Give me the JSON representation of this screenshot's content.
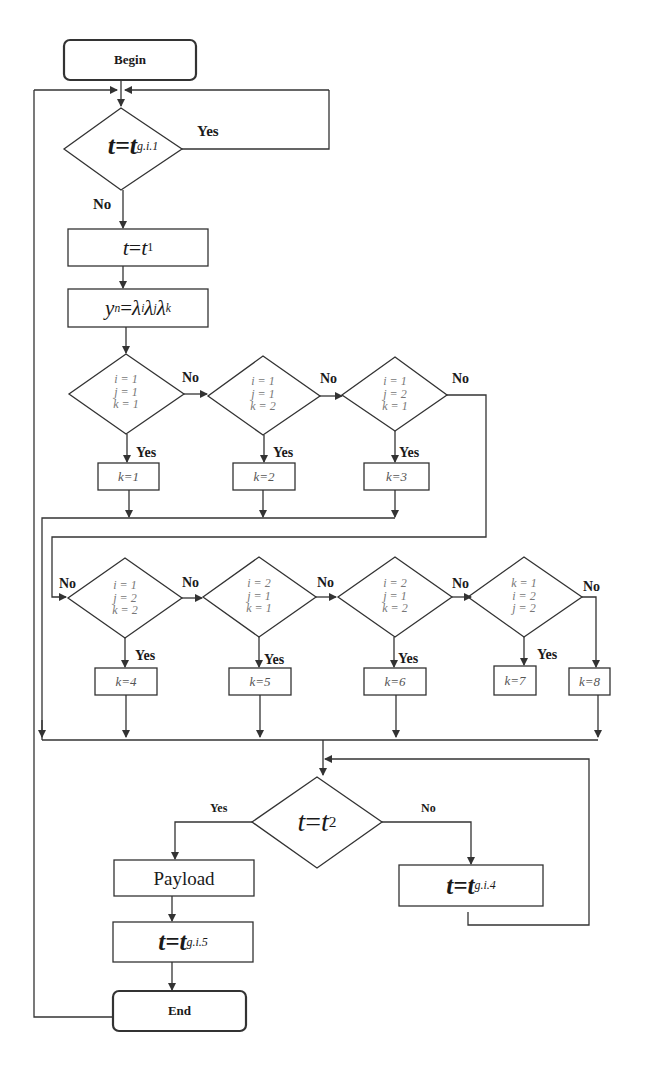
{
  "diagram": {
    "type": "flowchart",
    "start": {
      "label": "Begin"
    },
    "end": {
      "label": "End"
    },
    "decision_top": {
      "lhs": "t",
      "eq": "=",
      "rhs": "t",
      "sub": "g.i.1",
      "yes_label": "Yes",
      "no_label": "No"
    },
    "step_t1": {
      "lhs": "t",
      "eq": " = ",
      "rhs": "t",
      "sub": "1"
    },
    "step_yn": {
      "lhs": "y",
      "lhs_sub": "n",
      "eq": " = ",
      "f1": "λ",
      "s1": "i",
      "f2": "λ",
      "s2": "j",
      "f3": "λ",
      "s3": "k"
    },
    "decisions": [
      {
        "lines": [
          "i = 1",
          "j = 1",
          "k = 1"
        ],
        "yes_label": "Yes",
        "no_label": "No",
        "result": "k=1"
      },
      {
        "lines": [
          "i = 1",
          "j = 1",
          "k = 2"
        ],
        "yes_label": "Yes",
        "no_label": "No",
        "result": "k=2"
      },
      {
        "lines": [
          "i = 1",
          "j = 2",
          "k = 1"
        ],
        "yes_label": "Yes",
        "no_label": "No",
        "result": "k=3"
      },
      {
        "lines": [
          "i = 1",
          "j = 2",
          "k = 2"
        ],
        "yes_label": "Yes",
        "no_label": "No",
        "result": "k=4"
      },
      {
        "lines": [
          "i = 2",
          "j = 1",
          "k = 1"
        ],
        "yes_label": "Yes",
        "no_label": "No",
        "result": "k=5"
      },
      {
        "lines": [
          "i = 2",
          "j = 1",
          "k = 2"
        ],
        "yes_label": "Yes",
        "no_label": "No",
        "result": "k=6"
      },
      {
        "lines": [
          "k = 1",
          "i = 2",
          "j = 2"
        ],
        "yes_label": "Yes",
        "no_label": "No",
        "result": "k=7"
      }
    ],
    "fallback_result": "k=8",
    "decision_bottom": {
      "lhs": "t",
      "eq": "=",
      "rhs": "t",
      "sub": "2",
      "yes_label": "Yes",
      "no_label": "No"
    },
    "payload": {
      "label": "Payload"
    },
    "step_g4": {
      "lhs": "t",
      "eq": "=",
      "rhs": "t",
      "sub": "g.i.4"
    },
    "step_g5": {
      "lhs": "t",
      "eq": "=",
      "rhs": "t",
      "sub": "g.i.5"
    }
  },
  "colors": {
    "line": "#333333",
    "text": "#1a1a1a",
    "condition_text": "#777777",
    "background": "#ffffff"
  }
}
